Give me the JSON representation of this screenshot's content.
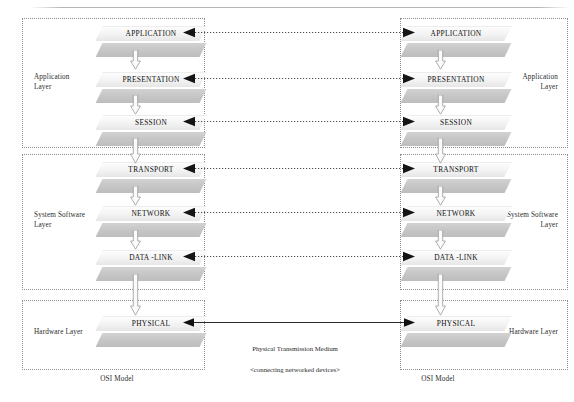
{
  "diagram": {
    "caption_left": "OSI Model",
    "caption_right": "OSI Model",
    "colors": {
      "slab_top": "#f2f2f2",
      "slab_bottom": "#c6c6c6",
      "box_border": "#8c8c8c",
      "arrow_line": "#4a4a4a",
      "medium_line": "#1a1a1a",
      "text": "#1a1a1a"
    }
  },
  "groups": [
    {
      "id": "application",
      "label": "Application\nLayer"
    },
    {
      "id": "system-software",
      "label": "System Software\nLayer"
    },
    {
      "id": "hardware",
      "label": "Hardware Layer"
    }
  ],
  "stacks": {
    "left": {
      "id": "left-stack",
      "caption": "OSI Model",
      "groups": [
        {
          "id": "application",
          "label": "Application\nLayer"
        },
        {
          "id": "system-software",
          "label": "System Software\nLayer"
        },
        {
          "id": "hardware",
          "label": "Hardware Layer"
        }
      ],
      "layers": [
        {
          "id": "application",
          "name": "APPLICATION",
          "group": "application"
        },
        {
          "id": "presentation",
          "name": "PRESENTATION",
          "group": "application"
        },
        {
          "id": "session",
          "name": "SESSION",
          "group": "application"
        },
        {
          "id": "transport",
          "name": "TRANSPORT",
          "group": "system-software"
        },
        {
          "id": "network",
          "name": "NETWORK",
          "group": "system-software"
        },
        {
          "id": "data-link",
          "name": "DATA -LINK",
          "group": "system-software"
        },
        {
          "id": "physical",
          "name": "PHYSICAL",
          "group": "hardware"
        }
      ]
    },
    "right": {
      "id": "right-stack",
      "caption": "OSI Model",
      "groups": [
        {
          "id": "application",
          "label": "Application\nLayer"
        },
        {
          "id": "system-software",
          "label": "System Software\nLayer"
        },
        {
          "id": "hardware",
          "label": "Hardware Layer"
        }
      ],
      "layers": [
        {
          "id": "application",
          "name": "APPLICATION",
          "group": "application"
        },
        {
          "id": "presentation",
          "name": "PRESENTATION",
          "group": "application"
        },
        {
          "id": "session",
          "name": "SESSION",
          "group": "application"
        },
        {
          "id": "transport",
          "name": "TRANSPORT",
          "group": "system-software"
        },
        {
          "id": "network",
          "name": "NETWORK",
          "group": "system-software"
        },
        {
          "id": "data-link",
          "name": "DATA -LINK",
          "group": "system-software"
        },
        {
          "id": "physical",
          "name": "PHYSICAL",
          "group": "hardware"
        }
      ]
    }
  },
  "peer_connections": [
    {
      "id": "application-peer",
      "layer": "APPLICATION",
      "style": "dotted",
      "heads": "both"
    },
    {
      "id": "presentation-peer",
      "layer": "PRESENTATION",
      "style": "dotted",
      "heads": "both"
    },
    {
      "id": "session-peer",
      "layer": "SESSION",
      "style": "dotted",
      "heads": "both"
    },
    {
      "id": "transport-peer",
      "layer": "TRANSPORT",
      "style": "dotted",
      "heads": "both"
    },
    {
      "id": "network-peer",
      "layer": "NETWORK",
      "style": "dotted",
      "heads": "both"
    },
    {
      "id": "data-link-peer",
      "layer": "DATA -LINK",
      "style": "dotted",
      "heads": "both"
    },
    {
      "id": "physical-peer",
      "layer": "PHYSICAL",
      "style": "solid",
      "heads": "both"
    }
  ],
  "medium": {
    "label": "Physical Transmission Medium\n<connecting networked devices>",
    "line1": "Physical Transmission Medium",
    "line2": "<connecting networked devices>"
  }
}
